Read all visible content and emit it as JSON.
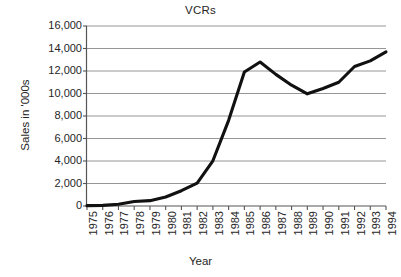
{
  "chart_data": {
    "type": "line",
    "title": "VCRs",
    "xlabel": "Year",
    "ylabel": "Sales in '000s",
    "grid": "horizontal",
    "legend": "none",
    "xlim": [
      1975,
      1994
    ],
    "ylim": [
      0,
      16000
    ],
    "ytick_labels": [
      "16,000",
      "14,000",
      "12,000",
      "10,000",
      "8,000",
      "6,000",
      "4,000",
      "2,000",
      "0"
    ],
    "ytick_values": [
      16000,
      14000,
      12000,
      10000,
      8000,
      6000,
      4000,
      2000,
      0
    ],
    "categories": [
      "1975",
      "1976",
      "1977",
      "1978",
      "1979",
      "1980",
      "1981",
      "1982",
      "1983",
      "1984",
      "1985",
      "1986",
      "1987",
      "1988",
      "1989",
      "1990",
      "1991",
      "1992",
      "1993",
      "1994"
    ],
    "x": [
      1975,
      1976,
      1977,
      1978,
      1979,
      1980,
      1981,
      1982,
      1983,
      1984,
      1985,
      1986,
      1987,
      1988,
      1989,
      1990,
      1991,
      1992,
      1993,
      1994
    ],
    "series": [
      {
        "name": "VCR sales",
        "color": "#111111",
        "values": [
          30,
          55,
          160,
          400,
          475,
          800,
          1360,
          2035,
          4020,
          7616,
          11912,
          12800,
          11700,
          10740,
          9970,
          10450,
          11000,
          12400,
          12900,
          13700
        ]
      }
    ]
  },
  "axis": {
    "y_axis_name": "y-axis",
    "x_axis_name": "x-axis"
  }
}
